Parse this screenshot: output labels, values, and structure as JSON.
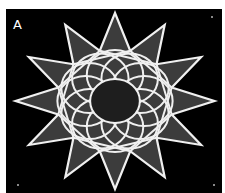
{
  "panel_label": "A",
  "figure": {
    "points": 12,
    "colors": {
      "background": "#000000",
      "fill": "#3c3c3c",
      "stroke": "#f0f0f0",
      "border": "#ffffff"
    }
  }
}
